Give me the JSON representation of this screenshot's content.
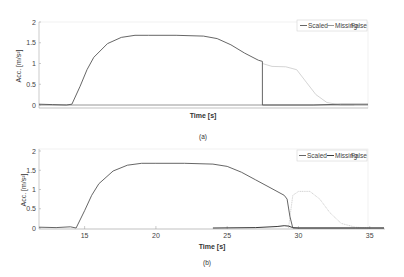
{
  "chart_data": [
    {
      "type": "line",
      "panel_label": "(a)",
      "xlabel": "Time [s]",
      "ylabel": "Acc. [m/s²]",
      "ylim": [
        0,
        2
      ],
      "xlim": [
        12,
        36
      ],
      "yticks": [
        "0",
        "0.5",
        "1",
        "1.5",
        "2"
      ],
      "xticks": [],
      "legend": {
        "position": "top-right",
        "entries": [
          "Scaled",
          "Missing",
          "False"
        ]
      },
      "series": [
        {
          "name": "Scaled",
          "color": "#555555",
          "x": [
            12,
            13,
            14,
            14.4,
            15,
            15.5,
            16,
            17,
            18,
            19,
            20,
            22,
            24,
            25,
            26,
            27,
            28,
            28.3,
            28.3,
            32,
            34,
            36
          ],
          "y": [
            0.02,
            0.01,
            0.0,
            0.02,
            0.45,
            0.85,
            1.15,
            1.48,
            1.63,
            1.68,
            1.68,
            1.68,
            1.66,
            1.6,
            1.45,
            1.25,
            1.08,
            1.05,
            0.0,
            0.0,
            0.02,
            0.02
          ]
        },
        {
          "name": "Missing",
          "color": "#8a8a8a",
          "x": [
            12,
            36
          ],
          "y": [
            0.0,
            0.0
          ]
        },
        {
          "name": "False",
          "color": "#cfcfcf",
          "x": [
            28.3,
            29,
            30,
            30.8,
            31.5,
            32.2,
            33,
            34,
            35
          ],
          "y": [
            1.0,
            0.93,
            0.92,
            0.85,
            0.55,
            0.25,
            0.06,
            0.0,
            0.0
          ]
        }
      ]
    },
    {
      "type": "line",
      "panel_label": "(b)",
      "xlabel": "Time [s]",
      "ylabel": "Acc. [m/s²]",
      "ylim": [
        0,
        2
      ],
      "xlim": [
        11.8,
        36
      ],
      "yticks": [
        "0",
        "0.5",
        "1",
        "1.5",
        "2"
      ],
      "xticks": [
        "15",
        "20",
        "25",
        "30",
        "35"
      ],
      "legend": {
        "position": "top-right",
        "entries": [
          "Scaled",
          "Missing",
          "False"
        ]
      },
      "series": [
        {
          "name": "Scaled",
          "color": "#555555",
          "x": [
            11.8,
            13,
            14,
            14.4,
            15,
            15.5,
            16,
            17,
            18,
            19,
            20,
            22,
            24,
            25,
            26,
            27,
            28,
            29,
            29.2,
            29.4,
            29.6,
            36
          ],
          "y": [
            0.02,
            0.01,
            0.03,
            0.0,
            0.45,
            0.85,
            1.15,
            1.48,
            1.63,
            1.68,
            1.68,
            1.68,
            1.66,
            1.6,
            1.45,
            1.25,
            1.05,
            0.85,
            0.75,
            0.3,
            0.0,
            0.0
          ]
        },
        {
          "name": "Missing",
          "color": "#222222",
          "x": [
            24,
            27,
            28.5,
            29,
            29.3,
            29.6,
            30,
            34,
            36
          ],
          "y": [
            0.0,
            0.01,
            0.04,
            0.06,
            0.05,
            0.01,
            0.0,
            0.0,
            0.0
          ]
        },
        {
          "name": "False",
          "color": "#cfcfcf",
          "x": [
            29.3,
            29.6,
            30,
            30.8,
            31.5,
            32.2,
            33,
            34,
            35
          ],
          "y": [
            0.0,
            0.85,
            0.95,
            0.95,
            0.75,
            0.4,
            0.12,
            0.02,
            0.0
          ]
        }
      ]
    }
  ]
}
